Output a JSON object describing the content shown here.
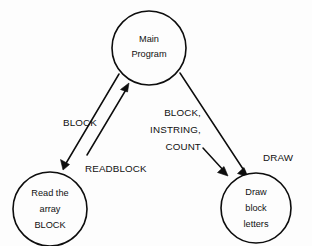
{
  "diagram": {
    "background_color": "#fdfdfd",
    "stroke_color": "#0d0d0d",
    "text_color": "#111111",
    "nodes": [
      {
        "id": "main-program",
        "name": "Main Program",
        "lines": [
          "Main",
          "Program"
        ],
        "cx": 149,
        "cy": 48,
        "r": 37
      },
      {
        "id": "read-block",
        "name": "Read the array BLOCK",
        "lines": [
          "Read the",
          "array",
          "BLOCK"
        ],
        "cx": 50,
        "cy": 209,
        "r": 37
      },
      {
        "id": "draw-block-letters",
        "name": "Draw block letters",
        "lines": [
          "Draw",
          "block",
          "letters"
        ],
        "cx": 256,
        "cy": 208,
        "r": 35
      }
    ],
    "edges": [
      {
        "id": "main-to-read",
        "from": "main-program",
        "to": "read-block",
        "direction": "down-left",
        "label": "BLOCK"
      },
      {
        "id": "read-to-main",
        "from": "read-block",
        "to": "main-program",
        "direction": "up-right",
        "label": "READBLOCK"
      },
      {
        "id": "main-to-draw-params",
        "from": "main-program",
        "to": "draw-block-letters",
        "direction": "down-right",
        "label": "BLOCK, INSTRING, COUNT"
      },
      {
        "id": "main-to-draw",
        "from": "main-program",
        "to": "draw-block-letters",
        "direction": "down-right",
        "label": "DRAW"
      }
    ],
    "labels": {
      "block": "BLOCK",
      "readblock": "READBLOCK",
      "params_line1": "BLOCK,",
      "params_line2": "INSTRING,",
      "params_line3": "COUNT",
      "draw": "DRAW"
    }
  }
}
